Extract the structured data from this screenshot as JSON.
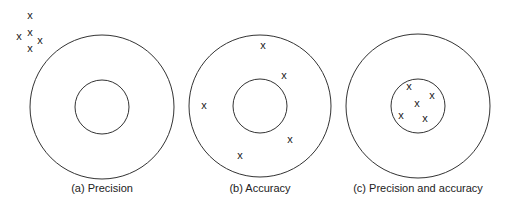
{
  "panels": [
    {
      "caption": "(a) Precision",
      "center": [
        102,
        107
      ],
      "outer_r": 72,
      "inner_r": 27,
      "caption_x": 102,
      "marks": [
        [
          30,
          15
        ],
        [
          19,
          36
        ],
        [
          30,
          32
        ],
        [
          40,
          40
        ],
        [
          30,
          48
        ]
      ]
    },
    {
      "caption": "(b) Accuracy",
      "center": [
        260,
        106
      ],
      "outer_r": 71,
      "inner_r": 27,
      "caption_x": 260,
      "marks": [
        [
          263,
          45
        ],
        [
          284,
          75
        ],
        [
          204,
          105
        ],
        [
          290,
          139
        ],
        [
          240,
          155
        ]
      ]
    },
    {
      "caption": "(c) Precision and accuracy",
      "center": [
        418,
        106
      ],
      "outer_r": 72,
      "inner_r": 27,
      "caption_x": 418,
      "marks": [
        [
          409,
          86
        ],
        [
          432,
          95
        ],
        [
          417,
          103
        ],
        [
          401,
          115
        ],
        [
          425,
          118
        ]
      ]
    }
  ],
  "mark_symbol": "x",
  "stroke_color": "#333333"
}
